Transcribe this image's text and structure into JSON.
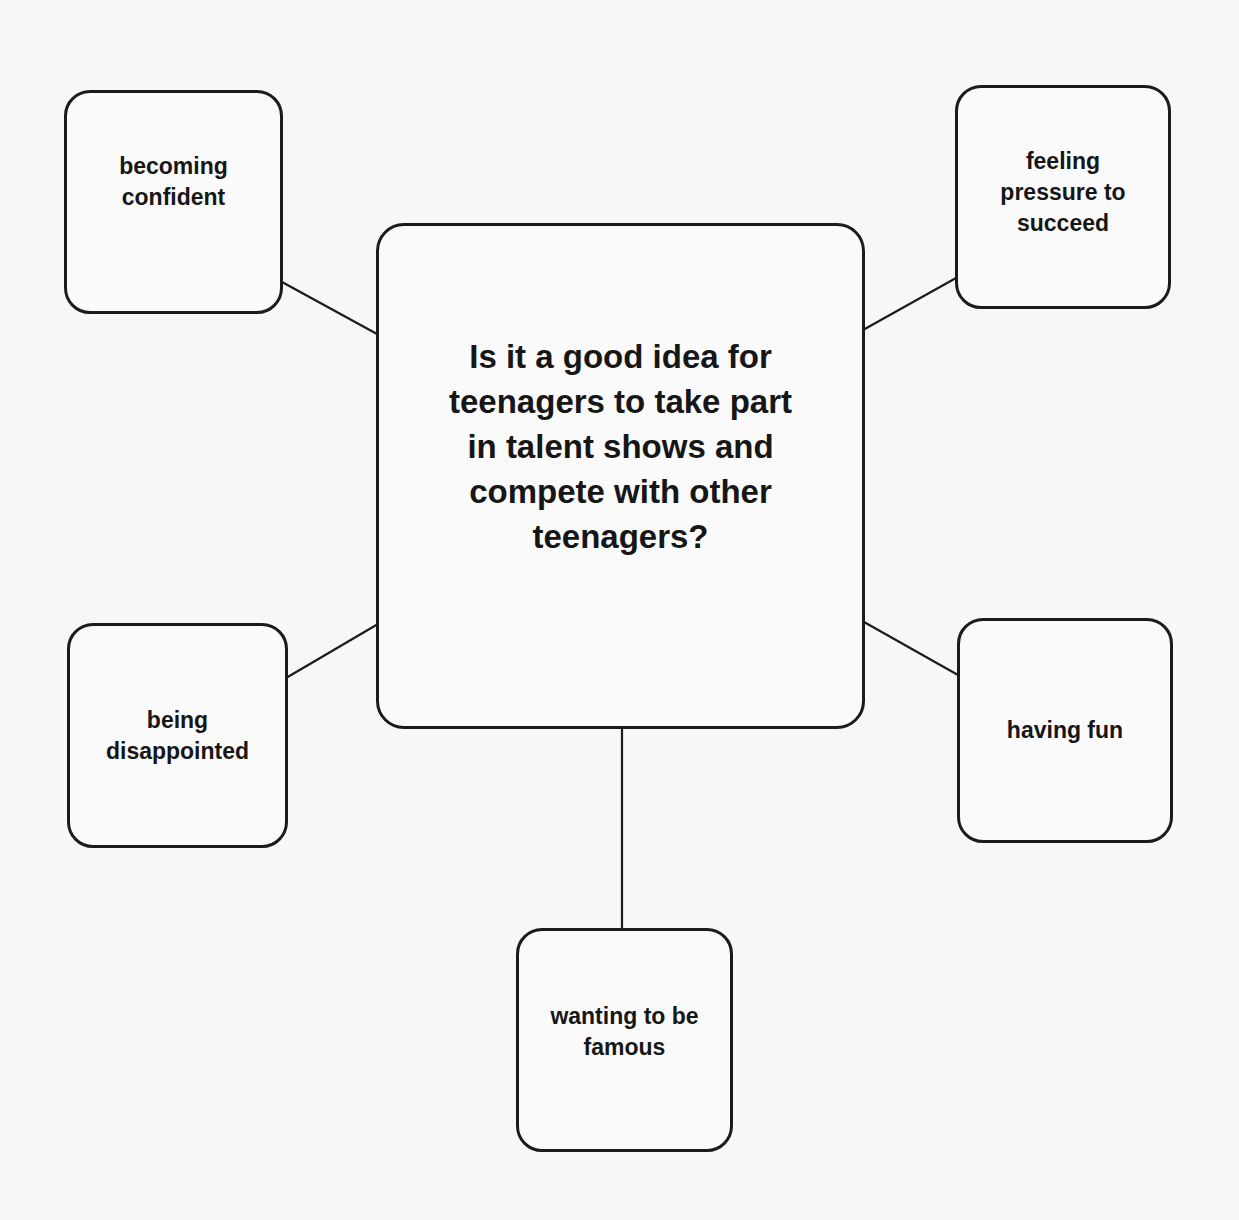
{
  "diagram": {
    "type": "mind-map",
    "central_question": "Is it a good idea for\nteenagers to take part\nin talent shows and\ncompete with other\nteenagers?",
    "nodes": [
      {
        "id": "top-left",
        "text": "becoming\nconfident"
      },
      {
        "id": "top-right",
        "text": "feeling\npressure to\nsucceed"
      },
      {
        "id": "mid-left",
        "text": "being\ndisappointed"
      },
      {
        "id": "mid-right",
        "text": "having fun"
      },
      {
        "id": "bottom",
        "text": "wanting to be\nfamous"
      }
    ]
  }
}
